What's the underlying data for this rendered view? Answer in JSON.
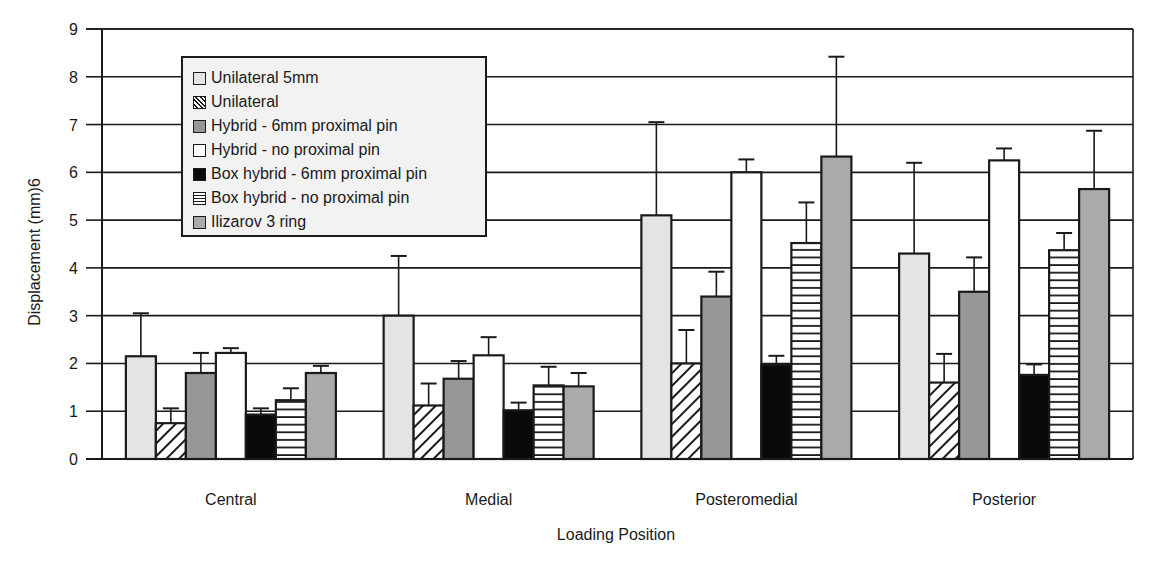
{
  "chart_data": {
    "type": "bar",
    "title": "",
    "xlabel": "Loading Position",
    "ylabel": "Displacement (mm)6",
    "ylim": [
      0,
      9
    ],
    "yticks": [
      0,
      1,
      2,
      3,
      4,
      5,
      6,
      7,
      8,
      9
    ],
    "grid": true,
    "legend_position": "upper-left (inside plot)",
    "categories": [
      "Central",
      "Medial",
      "Posteromedial",
      "Posterior"
    ],
    "series": [
      {
        "name": "Unilateral 5mm",
        "pattern": "light-gray",
        "values": [
          2.15,
          3.0,
          5.1,
          4.3
        ],
        "error_upper": [
          3.05,
          4.25,
          7.05,
          6.2
        ]
      },
      {
        "name": "Unilateral",
        "pattern": "diagonal-hatch",
        "values": [
          0.75,
          1.12,
          2.0,
          1.6
        ],
        "error_upper": [
          1.06,
          1.58,
          2.7,
          2.2
        ]
      },
      {
        "name": "Hybrid - 6mm proximal pin",
        "pattern": "dark-gray",
        "values": [
          1.8,
          1.68,
          3.4,
          3.5
        ],
        "error_upper": [
          2.22,
          2.05,
          3.92,
          4.22
        ]
      },
      {
        "name": "Hybrid - no proximal pin",
        "pattern": "white",
        "values": [
          2.22,
          2.17,
          6.0,
          6.25
        ],
        "error_upper": [
          2.32,
          2.55,
          6.27,
          6.5
        ]
      },
      {
        "name": "Box hybrid - 6mm proximal pin",
        "pattern": "black",
        "values": [
          0.93,
          1.02,
          1.97,
          1.76
        ],
        "error_upper": [
          1.06,
          1.18,
          2.16,
          1.98
        ]
      },
      {
        "name": "Box hybrid - no proximal pin",
        "pattern": "horizontal-stripes",
        "values": [
          1.23,
          1.54,
          4.52,
          4.37
        ],
        "error_upper": [
          1.48,
          1.93,
          5.37,
          4.73
        ]
      },
      {
        "name": "Ilizarov 3 ring",
        "pattern": "medium-gray",
        "values": [
          1.8,
          1.52,
          6.33,
          5.65
        ],
        "error_upper": [
          1.95,
          1.8,
          8.42,
          6.87
        ]
      }
    ],
    "colors": {
      "light-gray": "#e4e4e4",
      "dark-gray": "#979797",
      "white": "#ffffff",
      "black": "#0a0a0a",
      "medium-gray": "#aaaaaa",
      "line": "#1a1a1a"
    }
  },
  "legend": {
    "items": [
      {
        "label": "Unilateral 5mm",
        "swatch": "sw-light"
      },
      {
        "label": "Unilateral",
        "swatch": "sw-diag"
      },
      {
        "label": "Hybrid - 6mm proximal pin",
        "swatch": "sw-dark"
      },
      {
        "label": "Hybrid - no proximal pin",
        "swatch": "sw-white"
      },
      {
        "label": "Box hybrid - 6mm proximal pin",
        "swatch": "sw-black"
      },
      {
        "label": "Box hybrid - no proximal pin",
        "swatch": "sw-horiz"
      },
      {
        "label": "Ilizarov 3 ring",
        "swatch": "sw-mid"
      }
    ]
  }
}
